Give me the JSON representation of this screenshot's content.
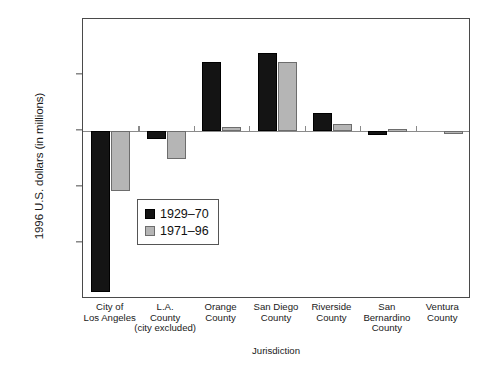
{
  "chart_data": {
    "type": "bar",
    "title": "",
    "xlabel": "Jurisdiction",
    "ylabel": "1996 U.S. dollars (in millions)",
    "ylim": [
      -1500,
      1000
    ],
    "yticks": [
      1000,
      500,
      0,
      -500,
      -1000,
      -1500
    ],
    "ytick_labels": [
      "1,000",
      "500",
      "0",
      "-500",
      "-1,000",
      "-1,500"
    ],
    "grid": false,
    "legend_position": "center-left",
    "categories": [
      "City of Los Angeles",
      "L.A. County (city excluded)",
      "Orange County",
      "San Diego County",
      "Riverside County",
      "San Bernardino County",
      "Ventura County"
    ],
    "category_label_lines": [
      [
        "City of",
        "Los Angeles"
      ],
      [
        "L.A.",
        "County",
        "(city excluded)"
      ],
      [
        "Orange",
        "County"
      ],
      [
        "San Diego",
        "County"
      ],
      [
        "Riverside",
        "County"
      ],
      [
        "San",
        "Bernardino",
        "County"
      ],
      [
        "Ventura",
        "County"
      ]
    ],
    "series": [
      {
        "name": "1929–70",
        "color": "#141414",
        "values": [
          -1440,
          -75,
          620,
          700,
          165,
          -35,
          0
        ]
      },
      {
        "name": "1971–96",
        "color": "#b5b5b5",
        "values": [
          -540,
          -250,
          40,
          615,
          60,
          15,
          -25
        ]
      }
    ]
  },
  "legend": {
    "items": [
      {
        "label": "1929–70",
        "swatch": "dark"
      },
      {
        "label": "1971–96",
        "swatch": "light"
      }
    ]
  },
  "axes": {
    "y_title": "1996 U.S. dollars (in millions)",
    "x_title": "Jurisdiction"
  }
}
